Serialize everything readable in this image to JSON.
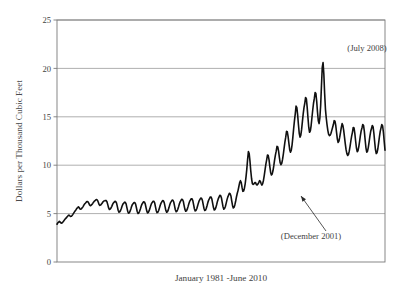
{
  "chart_data": {
    "type": "line",
    "title": "",
    "subtitle": "",
    "xlabel": "January 1981 -June 2010",
    "ylabel": "Dollars per Thousand Cubic Feet",
    "xlim": [
      0,
      353
    ],
    "ylim": [
      0,
      25
    ],
    "yticks": [
      0,
      5,
      10,
      15,
      20,
      25
    ],
    "ytick_labels": [
      "0",
      "5",
      "10",
      "15",
      "20",
      "25"
    ],
    "xticks": [],
    "xtick_labels": [],
    "grid": "horizontal",
    "legend": "none",
    "series_name": "Residential natural gas price",
    "line_color": "#101010",
    "line_width": 1.6,
    "annotations": [
      {
        "name": "july-2008-peak",
        "label": "(July 2008)",
        "x_index": 330,
        "value": 20.6,
        "text_x": 367,
        "text_y": 51,
        "arrow": false
      },
      {
        "name": "december-2001-trough",
        "label": "(December 2001)",
        "x_index": 251,
        "value": 8.0,
        "text_x": 311,
        "text_y": 239,
        "arrow": true,
        "arrow_from_x": 326,
        "arrow_from_y": 231,
        "arrow_to_x": 301,
        "arrow_to_y": 196
      }
    ],
    "x": "monthly, Jan 1981 through Jun 2010 (354 points)",
    "values": [
      3.9,
      4.05,
      4.12,
      4.2,
      4.12,
      4.02,
      4.0,
      4.1,
      4.18,
      4.3,
      4.42,
      4.5,
      4.58,
      4.7,
      4.78,
      4.85,
      4.78,
      4.7,
      4.72,
      4.8,
      4.92,
      5.05,
      5.18,
      5.3,
      5.4,
      5.55,
      5.62,
      5.7,
      5.6,
      5.48,
      5.45,
      5.52,
      5.62,
      5.75,
      5.9,
      6.02,
      6.1,
      6.2,
      6.25,
      6.22,
      6.08,
      5.9,
      5.82,
      5.86,
      5.95,
      6.05,
      6.18,
      6.28,
      6.35,
      6.42,
      6.45,
      6.38,
      6.18,
      5.95,
      5.85,
      5.88,
      5.98,
      6.1,
      6.22,
      6.3,
      6.32,
      6.36,
      6.34,
      6.2,
      5.9,
      5.58,
      5.42,
      5.46,
      5.58,
      5.75,
      5.95,
      6.1,
      6.18,
      6.26,
      6.24,
      6.08,
      5.72,
      5.35,
      5.15,
      5.18,
      5.32,
      5.52,
      5.78,
      5.98,
      6.08,
      6.18,
      6.16,
      6.0,
      5.62,
      5.25,
      5.05,
      5.08,
      5.25,
      5.48,
      5.75,
      5.95,
      6.05,
      6.15,
      6.14,
      5.98,
      5.6,
      5.22,
      5.02,
      5.06,
      5.24,
      5.48,
      5.76,
      5.98,
      6.1,
      6.22,
      6.2,
      6.04,
      5.66,
      5.28,
      5.08,
      5.12,
      5.3,
      5.54,
      5.82,
      6.04,
      6.16,
      6.28,
      6.26,
      6.1,
      5.7,
      5.3,
      5.1,
      5.14,
      5.32,
      5.58,
      5.86,
      6.08,
      6.22,
      6.34,
      6.32,
      6.14,
      5.74,
      5.34,
      5.14,
      5.18,
      5.36,
      5.62,
      5.92,
      6.14,
      6.26,
      6.4,
      6.38,
      6.2,
      5.8,
      5.4,
      5.2,
      5.24,
      5.42,
      5.68,
      5.98,
      6.2,
      6.34,
      6.48,
      6.46,
      6.28,
      5.86,
      5.46,
      5.24,
      5.28,
      5.46,
      5.72,
      6.02,
      6.26,
      6.4,
      6.54,
      6.52,
      6.34,
      5.92,
      5.5,
      5.28,
      5.32,
      5.5,
      5.78,
      6.08,
      6.32,
      6.46,
      6.6,
      6.58,
      6.4,
      5.98,
      5.56,
      5.32,
      5.36,
      5.56,
      5.84,
      6.16,
      6.4,
      6.56,
      6.72,
      6.7,
      6.5,
      6.06,
      5.62,
      5.38,
      5.42,
      5.62,
      5.92,
      6.26,
      6.52,
      6.7,
      6.88,
      6.86,
      6.64,
      6.18,
      5.72,
      5.46,
      5.52,
      5.74,
      6.06,
      6.42,
      6.7,
      6.9,
      7.1,
      7.06,
      6.82,
      6.32,
      5.84,
      5.58,
      5.66,
      5.92,
      6.3,
      6.74,
      7.1,
      7.4,
      7.8,
      8.2,
      8.4,
      8.2,
      7.7,
      7.3,
      7.34,
      7.62,
      8.1,
      8.8,
      9.6,
      10.6,
      11.4,
      11.2,
      10.4,
      9.4,
      8.6,
      8.1,
      8.02,
      8.08,
      8.2,
      8.2,
      8.0,
      7.95,
      8.05,
      8.2,
      8.4,
      8.35,
      8.1,
      7.95,
      8.1,
      8.45,
      8.95,
      9.55,
      10.1,
      10.55,
      11.05,
      11.0,
      10.55,
      9.85,
      9.25,
      9.0,
      9.1,
      9.45,
      9.95,
      10.55,
      11.05,
      11.45,
      11.95,
      11.9,
      11.45,
      10.8,
      10.25,
      10.05,
      10.2,
      10.6,
      11.15,
      11.8,
      12.4,
      12.9,
      13.5,
      13.45,
      12.95,
      12.25,
      11.6,
      11.35,
      11.55,
      12.1,
      12.9,
      13.8,
      14.6,
      15.3,
      16.1,
      15.95,
      15.2,
      14.2,
      13.3,
      12.9,
      13.1,
      13.7,
      14.5,
      15.3,
      15.95,
      16.4,
      17.0,
      16.85,
      16.0,
      14.9,
      13.9,
      13.4,
      13.55,
      14.1,
      14.9,
      15.7,
      16.4,
      16.9,
      17.5,
      17.4,
      16.6,
      15.5,
      14.6,
      14.3,
      14.9,
      16.2,
      18.2,
      20.1,
      20.6,
      19.4,
      17.4,
      15.8,
      14.9,
      14.2,
      13.6,
      13.2,
      13.05,
      13.1,
      13.3,
      13.6,
      13.9,
      14.2,
      14.6,
      14.55,
      14.1,
      13.4,
      12.7,
      12.35,
      12.5,
      12.9,
      13.4,
      13.9,
      14.3,
      14.1,
      13.6,
      12.9,
      12.2,
      11.6,
      11.2,
      11.0,
      11.1,
      11.45,
      11.95,
      12.5,
      13.0,
      13.4,
      13.9,
      13.85,
      13.3,
      12.5,
      11.8,
      11.4,
      11.5,
      11.9,
      12.45,
      13.05,
      13.55,
      13.85,
      14.2,
      14.1,
      13.5,
      12.6,
      11.8,
      11.35,
      11.45,
      11.85,
      12.4,
      13.0,
      13.5,
      13.8,
      14.1,
      13.95,
      13.3,
      12.4,
      11.6,
      11.2,
      11.3,
      11.7,
      12.3,
      12.95,
      13.5,
      13.85,
      14.2,
      14.05,
      13.4,
      12.45,
      11.55
    ]
  },
  "figure": {
    "plot_area": {
      "left": 57,
      "top": 20,
      "right": 385,
      "bottom": 262
    },
    "border_color": "#7a7a7a",
    "grid_color": "#9a9a9a",
    "background": "#ffffff"
  }
}
